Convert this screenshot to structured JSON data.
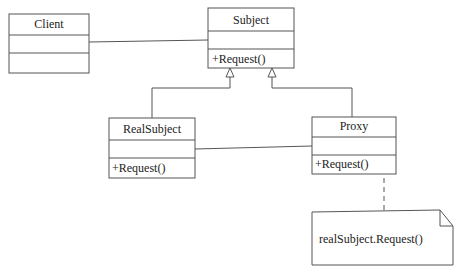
{
  "diagram": {
    "type": "UML class diagram",
    "pattern": "Proxy",
    "classes": [
      {
        "id": "client",
        "name": "Client",
        "attributes": "",
        "operations": ""
      },
      {
        "id": "subject",
        "name": "Subject",
        "attributes": "",
        "operations": "+Request()"
      },
      {
        "id": "realsubject",
        "name": "RealSubject",
        "attributes": "",
        "operations": "+Request()"
      },
      {
        "id": "proxy",
        "name": "Proxy",
        "attributes": "",
        "operations": "+Request()"
      }
    ],
    "note": {
      "text": "realSubject.Request()",
      "attached_to": "proxy"
    },
    "relations": [
      {
        "from": "client",
        "to": "subject",
        "kind": "association"
      },
      {
        "from": "realsubject",
        "to": "subject",
        "kind": "generalization"
      },
      {
        "from": "proxy",
        "to": "subject",
        "kind": "generalization"
      },
      {
        "from": "proxy",
        "to": "realsubject",
        "kind": "association"
      },
      {
        "from": "note",
        "to": "proxy",
        "kind": "note-anchor"
      }
    ]
  },
  "colors": {
    "line": "#555555",
    "background": "#ffffff"
  }
}
